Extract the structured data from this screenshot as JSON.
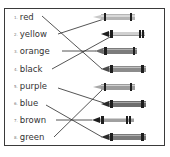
{
  "worksheet": {
    "words": [
      {
        "num": "1.",
        "label": "red"
      },
      {
        "num": "2.",
        "label": "yellow"
      },
      {
        "num": "3.",
        "label": "orange"
      },
      {
        "num": "4.",
        "label": "black"
      },
      {
        "num": "5.",
        "label": "purple"
      },
      {
        "num": "6.",
        "label": "blue"
      },
      {
        "num": "7.",
        "label": "brown"
      },
      {
        "num": "8.",
        "label": "green"
      }
    ],
    "crayon_count": 8,
    "matches": [
      {
        "word": "red",
        "crayon_index": 4
      },
      {
        "word": "yellow",
        "crayon_index": 1
      },
      {
        "word": "orange",
        "crayon_index": 3
      },
      {
        "word": "black",
        "crayon_index": 2
      },
      {
        "word": "purple",
        "crayon_index": 6
      },
      {
        "word": "blue",
        "crayon_index": 8
      },
      {
        "word": "brown",
        "crayon_index": 7
      },
      {
        "word": "green",
        "crayon_index": 5
      }
    ],
    "colors": {
      "border": "#3a3a3a",
      "line": "#2a2a2a",
      "crayon_body": "#9a9a9a",
      "crayon_band": "#1e1e1e"
    }
  }
}
